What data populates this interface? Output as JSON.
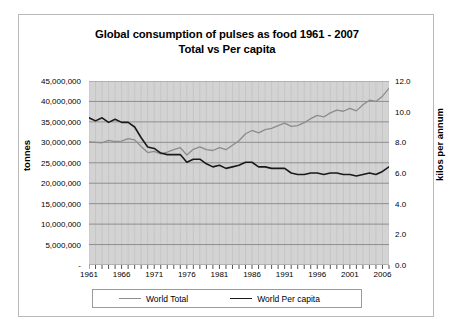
{
  "chart_data": {
    "type": "line",
    "title": "Global consumption of pulses as food 1961 - 2007",
    "subtitle": "Total vs Per capita",
    "xlabel": "",
    "ylabel": "tonnes",
    "y2label": "kilos per annum",
    "grid": true,
    "legend_position": "bottom",
    "plot_background": "#d3d3d3",
    "x": [
      1961,
      1962,
      1963,
      1964,
      1965,
      1966,
      1967,
      1968,
      1969,
      1970,
      1971,
      1972,
      1973,
      1974,
      1975,
      1976,
      1977,
      1978,
      1979,
      1980,
      1981,
      1982,
      1983,
      1984,
      1985,
      1986,
      1987,
      1988,
      1989,
      1990,
      1991,
      1992,
      1993,
      1994,
      1995,
      1996,
      1997,
      1998,
      1999,
      2000,
      2001,
      2002,
      2003,
      2004,
      2005,
      2006,
      2007
    ],
    "xlim": [
      1961,
      2007
    ],
    "xticks": [
      "1961",
      "1966",
      "1971",
      "1976",
      "1981",
      "1986",
      "1991",
      "1996",
      "2001",
      "2006"
    ],
    "xtick_values": [
      1961,
      1966,
      1971,
      1976,
      1981,
      1986,
      1991,
      1996,
      2001,
      2006
    ],
    "ylim": [
      0,
      45000000
    ],
    "yticks": [
      "-",
      "5,000,000",
      "10,000,000",
      "15,000,000",
      "20,000,000",
      "25,000,000",
      "30,000,000",
      "35,000,000",
      "40,000,000",
      "45,000,000"
    ],
    "ytick_values": [
      0,
      5000000,
      10000000,
      15000000,
      20000000,
      25000000,
      30000000,
      35000000,
      40000000,
      45000000
    ],
    "y2lim": [
      0,
      12
    ],
    "y2ticks": [
      "0.0",
      "2.0",
      "4.0",
      "6.0",
      "8.0",
      "10.0",
      "12.0"
    ],
    "y2tick_values": [
      0,
      2,
      4,
      6,
      8,
      10,
      12
    ],
    "series": [
      {
        "name": "World Total",
        "axis": "left",
        "color": "#8c8c8c",
        "units": "tonnes",
        "values": [
          30100000,
          30000000,
          29900000,
          30500000,
          30200000,
          30300000,
          30900000,
          30600000,
          29000000,
          27500000,
          27800000,
          27200000,
          27600000,
          28200000,
          28700000,
          26900000,
          28300000,
          28900000,
          28200000,
          28000000,
          28700000,
          28200000,
          29300000,
          30400000,
          32100000,
          32900000,
          32300000,
          33100000,
          33400000,
          34100000,
          34700000,
          33900000,
          34100000,
          34800000,
          35800000,
          36600000,
          36200000,
          37200000,
          37900000,
          37600000,
          38300000,
          37700000,
          39200000,
          40300000,
          40000000,
          41300000,
          43200000
        ]
      },
      {
        "name": "World Per capita",
        "axis": "right",
        "color": "#1a1a1a",
        "units": "kilos per annum",
        "values": [
          9.6,
          9.4,
          9.6,
          9.3,
          9.5,
          9.3,
          9.3,
          9.0,
          8.3,
          7.7,
          7.6,
          7.3,
          7.2,
          7.2,
          7.2,
          6.7,
          6.9,
          6.9,
          6.6,
          6.4,
          6.5,
          6.3,
          6.4,
          6.5,
          6.7,
          6.7,
          6.4,
          6.4,
          6.3,
          6.3,
          6.3,
          6.0,
          5.9,
          5.9,
          6.0,
          6.0,
          5.9,
          6.0,
          6.0,
          5.9,
          5.9,
          5.8,
          5.9,
          6.0,
          5.9,
          6.1,
          6.4
        ]
      }
    ]
  }
}
